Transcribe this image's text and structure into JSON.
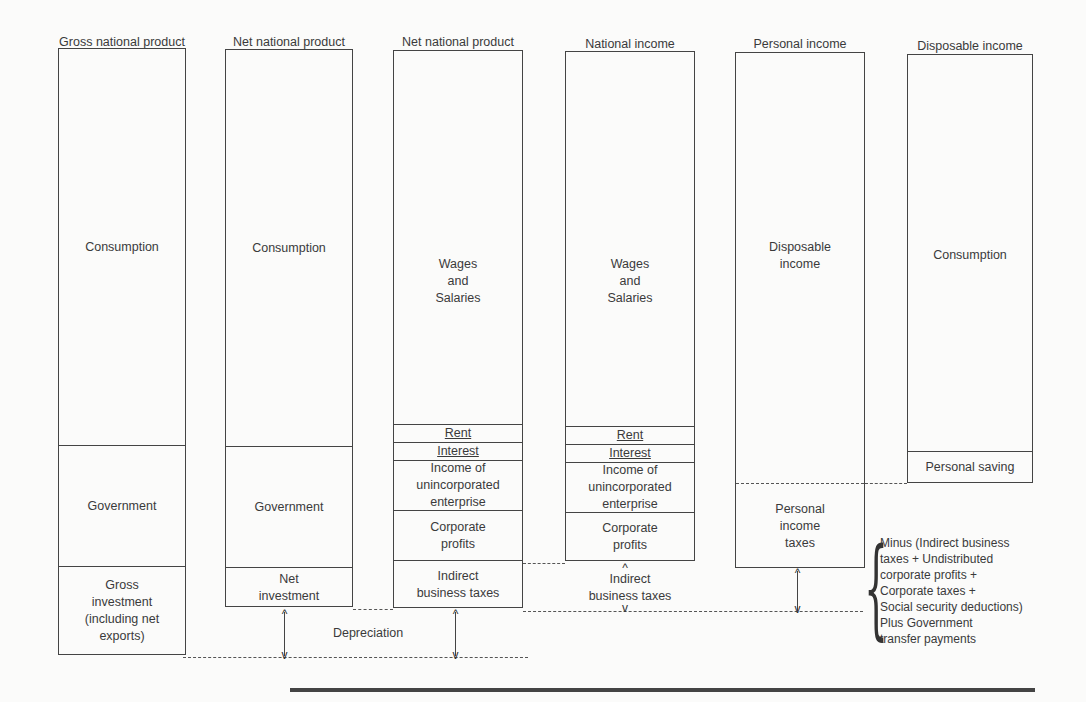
{
  "columns": [
    {
      "title": "Gross national product",
      "segments": [
        "Consumption",
        "Government",
        "Gross\ninvestment\n(including net\nexports)"
      ]
    },
    {
      "title": "Net national product",
      "segments": [
        "Consumption",
        "Government",
        "Net\ninvestment"
      ]
    },
    {
      "title": "Net national product",
      "segments": [
        "Wages\nand\nSalaries",
        "Rent",
        "Interest",
        "Income of\nunincorporated\nenterprise",
        "Corporate\nprofits",
        "Indirect\nbusiness taxes"
      ]
    },
    {
      "title": "National income",
      "segments": [
        "Wages\nand\nSalaries",
        "Rent",
        "Interest",
        "Income of\nunincorporated\nenterprise",
        "Corporate\nprofits"
      ]
    },
    {
      "title": "Personal income",
      "segments": [
        "Disposable\nincome",
        "Personal\nincome\ntaxes"
      ]
    },
    {
      "title": "Disposable income",
      "segments": [
        "Consumption",
        "Personal saving"
      ]
    }
  ],
  "annotations": {
    "depreciation": "Depreciation",
    "indirect_business_taxes": "Indirect\nbusiness taxes",
    "adjustment_note": [
      "Minus (Indirect business",
      "taxes + Undistributed",
      "corporate profits +",
      "Corporate taxes +",
      "Social security deductions)",
      "Plus Government",
      "transfer payments"
    ]
  }
}
